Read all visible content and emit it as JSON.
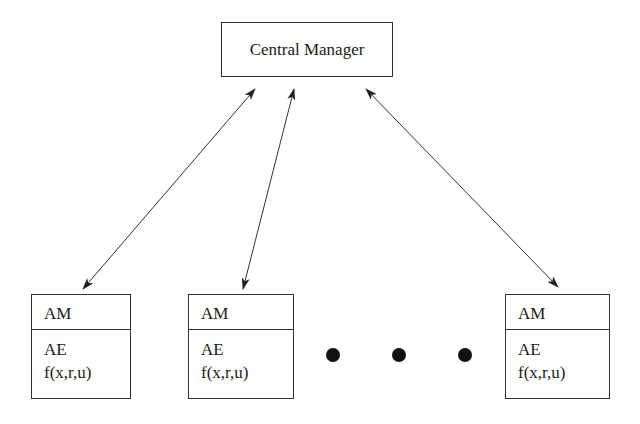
{
  "diagram": {
    "central": {
      "label": "Central Manager"
    },
    "agents": [
      {
        "header": "AM",
        "line1": "AE",
        "line2": "f(x,r,u)"
      },
      {
        "header": "AM",
        "line1": "AE",
        "line2": "f(x,r,u)"
      },
      {
        "header": "AM",
        "line1": "AE",
        "line2": "f(x,r,u)"
      }
    ],
    "ellipsis_dots": 3,
    "edges": [
      {
        "from": "Central Manager",
        "to": "Agent 1",
        "type": "bidirectional"
      },
      {
        "from": "Central Manager",
        "to": "Agent 2",
        "type": "bidirectional"
      },
      {
        "from": "Central Manager",
        "to": "Agent N",
        "type": "bidirectional"
      }
    ]
  }
}
